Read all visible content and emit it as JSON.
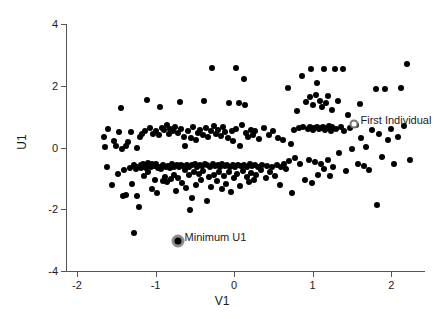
{
  "chart_data": {
    "type": "scatter",
    "title": "",
    "xlabel": "V1",
    "ylabel": "U1",
    "xlim": [
      -2.14,
      2.43
    ],
    "ylim": [
      -4.0,
      4.0
    ],
    "xticks": [
      -2,
      -1,
      0,
      1,
      2
    ],
    "xticklabels": [
      "-2",
      "-1",
      "0",
      "1",
      "2"
    ],
    "yticks": [
      -4,
      -2,
      0,
      2,
      4
    ],
    "yticklabels": [
      "-4",
      "-2",
      "0",
      "2",
      "4"
    ],
    "grid": false,
    "legend": null,
    "marker": "filled-circle",
    "marker_color": "#000000",
    "n_points": 281,
    "annotations": [
      {
        "label": "First Individual",
        "x": 1.52,
        "y": 0.75,
        "marker": "open-circle-highlight",
        "label_offset": [
          0.07,
          0.3
        ]
      },
      {
        "label": "Minimum U1",
        "x": -0.72,
        "y": -3.02,
        "marker": "ringed-dot-highlight",
        "label_offset": [
          0.07,
          0.3
        ]
      }
    ],
    "points": [
      [
        -1.66,
        0.33
      ],
      [
        -1.64,
        0.03
      ],
      [
        -1.62,
        -0.63
      ],
      [
        -1.6,
        0.59
      ],
      [
        -1.55,
        -1.22
      ],
      [
        -1.53,
        0.22
      ],
      [
        -1.5,
        0.04
      ],
      [
        -1.48,
        -0.86
      ],
      [
        -1.46,
        0.5
      ],
      [
        -1.44,
        1.27
      ],
      [
        -1.43,
        -0.05
      ],
      [
        -1.41,
        -1.58
      ],
      [
        -1.4,
        -0.74
      ],
      [
        -1.38,
        0.05
      ],
      [
        -1.37,
        -1.53
      ],
      [
        -1.35,
        0.17
      ],
      [
        -1.33,
        -0.66
      ],
      [
        -1.31,
        0.51
      ],
      [
        -1.3,
        -1.19
      ],
      [
        -1.28,
        -0.58
      ],
      [
        -1.27,
        -2.78
      ],
      [
        -1.25,
        -0.7
      ],
      [
        -1.24,
        0.0
      ],
      [
        -1.23,
        -1.57
      ],
      [
        -1.22,
        -0.62
      ],
      [
        -1.21,
        -1.93
      ],
      [
        -1.2,
        0.33
      ],
      [
        -1.19,
        -0.58
      ],
      [
        -1.18,
        -0.68
      ],
      [
        -1.17,
        0.45
      ],
      [
        -1.16,
        -0.55
      ],
      [
        -1.15,
        -0.92
      ],
      [
        -1.14,
        -0.6
      ],
      [
        -1.13,
        0.52
      ],
      [
        -1.12,
        -0.65
      ],
      [
        -1.11,
        1.53
      ],
      [
        -1.1,
        -0.5
      ],
      [
        -1.09,
        -0.78
      ],
      [
        -1.08,
        -0.57
      ],
      [
        -1.07,
        0.63
      ],
      [
        -1.06,
        -0.63
      ],
      [
        -1.05,
        -1.35
      ],
      [
        -1.04,
        -0.52
      ],
      [
        -1.03,
        0.43
      ],
      [
        -1.02,
        -0.6
      ],
      [
        -1.01,
        -1.06
      ],
      [
        -1.0,
        -0.55
      ],
      [
        -0.99,
        0.55
      ],
      [
        -0.98,
        -1.48
      ],
      [
        -0.97,
        -0.68
      ],
      [
        -0.96,
        0.4
      ],
      [
        -0.95,
        -0.62
      ],
      [
        -0.94,
        1.3
      ],
      [
        -0.93,
        -0.7
      ],
      [
        -0.92,
        0.63
      ],
      [
        -0.91,
        -1.08
      ],
      [
        -0.9,
        -0.57
      ],
      [
        -0.89,
        0.58
      ],
      [
        -0.88,
        -0.95
      ],
      [
        -0.87,
        -0.62
      ],
      [
        -0.86,
        0.72
      ],
      [
        -0.85,
        -1.12
      ],
      [
        -0.84,
        -0.6
      ],
      [
        -0.83,
        0.45
      ],
      [
        -0.82,
        -0.66
      ],
      [
        -0.81,
        0.6
      ],
      [
        -0.8,
        -1.03
      ],
      [
        -0.79,
        -0.55
      ],
      [
        -0.78,
        0.54
      ],
      [
        -0.77,
        -0.88
      ],
      [
        -0.76,
        -0.62
      ],
      [
        -0.75,
        0.66
      ],
      [
        -0.74,
        -1.42
      ],
      [
        -0.73,
        -0.58
      ],
      [
        -0.72,
        0.47
      ],
      [
        -0.71,
        -0.99
      ],
      [
        -0.7,
        -0.64
      ],
      [
        -0.69,
        1.48
      ],
      [
        -0.68,
        -0.57
      ],
      [
        -0.67,
        0.61
      ],
      [
        -0.66,
        -1.16
      ],
      [
        -0.65,
        -0.6
      ],
      [
        -0.64,
        0.35
      ],
      [
        -0.63,
        -0.72
      ],
      [
        -0.62,
        0.05
      ],
      [
        -0.61,
        -1.3
      ],
      [
        -0.6,
        -0.58
      ],
      [
        -0.59,
        0.52
      ],
      [
        -0.58,
        -0.9
      ],
      [
        -0.57,
        -0.63
      ],
      [
        -0.56,
        -2.04
      ],
      [
        -0.55,
        0.3
      ],
      [
        -0.54,
        -1.62
      ],
      [
        -0.53,
        -0.58
      ],
      [
        -0.52,
        0.68
      ],
      [
        -0.51,
        -0.8
      ],
      [
        -0.5,
        -0.55
      ],
      [
        -0.49,
        0.25
      ],
      [
        -0.48,
        -1.22
      ],
      [
        -0.47,
        -0.62
      ],
      [
        -0.46,
        0.48
      ],
      [
        -0.45,
        -0.85
      ],
      [
        -0.44,
        -0.56
      ],
      [
        -0.43,
        0.58
      ],
      [
        -0.42,
        -1.05
      ],
      [
        -0.41,
        -0.6
      ],
      [
        -0.4,
        0.4
      ],
      [
        -0.39,
        -0.75
      ],
      [
        -0.38,
        1.5
      ],
      [
        -0.37,
        -0.54
      ],
      [
        -0.36,
        0.62
      ],
      [
        -0.35,
        -1.72
      ],
      [
        -0.34,
        -0.58
      ],
      [
        -0.33,
        0.33
      ],
      [
        -0.32,
        -0.95
      ],
      [
        -0.31,
        -0.62
      ],
      [
        -0.3,
        0.55
      ],
      [
        -0.29,
        -1.28
      ],
      [
        -0.28,
        2.57
      ],
      [
        -0.27,
        -0.52
      ],
      [
        -0.26,
        0.7
      ],
      [
        -0.25,
        -0.88
      ],
      [
        -0.24,
        -0.6
      ],
      [
        -0.23,
        0.45
      ],
      [
        -0.22,
        -1.1
      ],
      [
        -0.21,
        -0.56
      ],
      [
        -0.2,
        0.58
      ],
      [
        -0.19,
        -0.8
      ],
      [
        -0.18,
        -0.62
      ],
      [
        -0.17,
        0.38
      ],
      [
        -0.16,
        -1.35
      ],
      [
        -0.15,
        -0.55
      ],
      [
        -0.14,
        0.65
      ],
      [
        -0.13,
        -0.92
      ],
      [
        -0.12,
        -0.6
      ],
      [
        -0.11,
        0.5
      ],
      [
        -0.1,
        -1.18
      ],
      [
        -0.09,
        -0.57
      ],
      [
        -0.08,
        0.3
      ],
      [
        -0.07,
        -0.78
      ],
      [
        -0.06,
        1.45
      ],
      [
        -0.05,
        -0.62
      ],
      [
        -0.04,
        -1.45
      ],
      [
        -0.03,
        0.55
      ],
      [
        -0.02,
        -0.58
      ],
      [
        -0.01,
        0.22
      ],
      [
        0.0,
        -1.0
      ],
      [
        0.01,
        -0.63
      ],
      [
        0.02,
        2.57
      ],
      [
        0.03,
        0.6
      ],
      [
        0.04,
        -0.85
      ],
      [
        0.05,
        -0.56
      ],
      [
        0.06,
        1.45
      ],
      [
        0.07,
        0.05
      ],
      [
        0.08,
        -1.25
      ],
      [
        0.09,
        -0.6
      ],
      [
        0.1,
        0.72
      ],
      [
        0.11,
        -0.75
      ],
      [
        0.12,
        2.22
      ],
      [
        0.13,
        -0.58
      ],
      [
        0.14,
        1.38
      ],
      [
        0.15,
        0.48
      ],
      [
        0.16,
        -0.95
      ],
      [
        0.17,
        -0.62
      ],
      [
        0.18,
        0.35
      ],
      [
        0.19,
        -1.12
      ],
      [
        0.2,
        -0.55
      ],
      [
        0.21,
        0.58
      ],
      [
        0.22,
        -0.82
      ],
      [
        0.23,
        -0.6
      ],
      [
        0.24,
        0.42
      ],
      [
        0.25,
        -1.05
      ],
      [
        0.26,
        -0.57
      ],
      [
        0.27,
        0.52
      ],
      [
        0.28,
        -0.88
      ],
      [
        0.3,
        -0.62
      ],
      [
        0.32,
        0.28
      ],
      [
        0.34,
        -0.72
      ],
      [
        0.36,
        -0.58
      ],
      [
        0.38,
        0.62
      ],
      [
        0.4,
        -0.98
      ],
      [
        0.42,
        -0.6
      ],
      [
        0.44,
        0.4
      ],
      [
        0.46,
        -0.8
      ],
      [
        0.48,
        -0.64
      ],
      [
        0.5,
        0.55
      ],
      [
        0.52,
        -0.92
      ],
      [
        0.54,
        -0.58
      ],
      [
        0.56,
        0.32
      ],
      [
        0.58,
        -1.22
      ],
      [
        0.6,
        -0.62
      ],
      [
        0.62,
        0.25
      ],
      [
        0.64,
        -0.55
      ],
      [
        0.66,
        -0.7
      ],
      [
        0.68,
        1.92
      ],
      [
        0.7,
        -0.45
      ],
      [
        0.72,
        0.12
      ],
      [
        0.74,
        -1.48
      ],
      [
        0.76,
        0.58
      ],
      [
        0.78,
        -0.35
      ],
      [
        0.8,
        1.18
      ],
      [
        0.82,
        0.62
      ],
      [
        0.84,
        -0.52
      ],
      [
        0.86,
        2.32
      ],
      [
        0.88,
        0.65
      ],
      [
        0.9,
        -1.05
      ],
      [
        0.92,
        1.48
      ],
      [
        0.94,
        0.6
      ],
      [
        0.95,
        -0.42
      ],
      [
        0.96,
        1.62
      ],
      [
        0.97,
        0.68
      ],
      [
        0.98,
        2.55
      ],
      [
        0.99,
        -1.15
      ],
      [
        1.0,
        0.58
      ],
      [
        1.01,
        1.38
      ],
      [
        1.02,
        0.62
      ],
      [
        1.03,
        -0.48
      ],
      [
        1.04,
        1.7
      ],
      [
        1.05,
        0.66
      ],
      [
        1.06,
        2.1
      ],
      [
        1.07,
        -0.88
      ],
      [
        1.08,
        0.6
      ],
      [
        1.09,
        1.52
      ],
      [
        1.1,
        0.64
      ],
      [
        1.11,
        -0.55
      ],
      [
        1.12,
        1.3
      ],
      [
        1.13,
        0.68
      ],
      [
        1.14,
        2.55
      ],
      [
        1.15,
        -0.7
      ],
      [
        1.16,
        0.58
      ],
      [
        1.17,
        1.45
      ],
      [
        1.18,
        0.62
      ],
      [
        1.19,
        -0.4
      ],
      [
        1.2,
        1.68
      ],
      [
        1.21,
        0.7
      ],
      [
        1.22,
        -0.92
      ],
      [
        1.23,
        0.55
      ],
      [
        1.24,
        1.22
      ],
      [
        1.25,
        0.65
      ],
      [
        1.26,
        -0.62
      ],
      [
        1.28,
        2.55
      ],
      [
        1.3,
        0.6
      ],
      [
        1.32,
        1.5
      ],
      [
        1.34,
        -0.18
      ],
      [
        1.36,
        0.68
      ],
      [
        1.38,
        2.55
      ],
      [
        1.4,
        0.55
      ],
      [
        1.42,
        -0.75
      ],
      [
        1.45,
        1.05
      ],
      [
        1.48,
        0.62
      ],
      [
        1.5,
        -0.05
      ],
      [
        1.55,
        0.72
      ],
      [
        1.58,
        -0.55
      ],
      [
        1.6,
        1.42
      ],
      [
        1.62,
        0.3
      ],
      [
        1.65,
        -0.6
      ],
      [
        1.68,
        0.02
      ],
      [
        1.72,
        -0.72
      ],
      [
        1.76,
        0.58
      ],
      [
        1.8,
        1.9
      ],
      [
        1.82,
        -1.85
      ],
      [
        1.85,
        0.45
      ],
      [
        1.88,
        -0.3
      ],
      [
        1.92,
        1.88
      ],
      [
        1.96,
        0.25
      ],
      [
        2.0,
        0.6
      ],
      [
        2.04,
        -0.52
      ],
      [
        2.08,
        0.35
      ],
      [
        2.12,
        1.92
      ],
      [
        2.16,
        0.7
      ],
      [
        2.2,
        2.7
      ],
      [
        2.24,
        -0.42
      ]
    ]
  }
}
